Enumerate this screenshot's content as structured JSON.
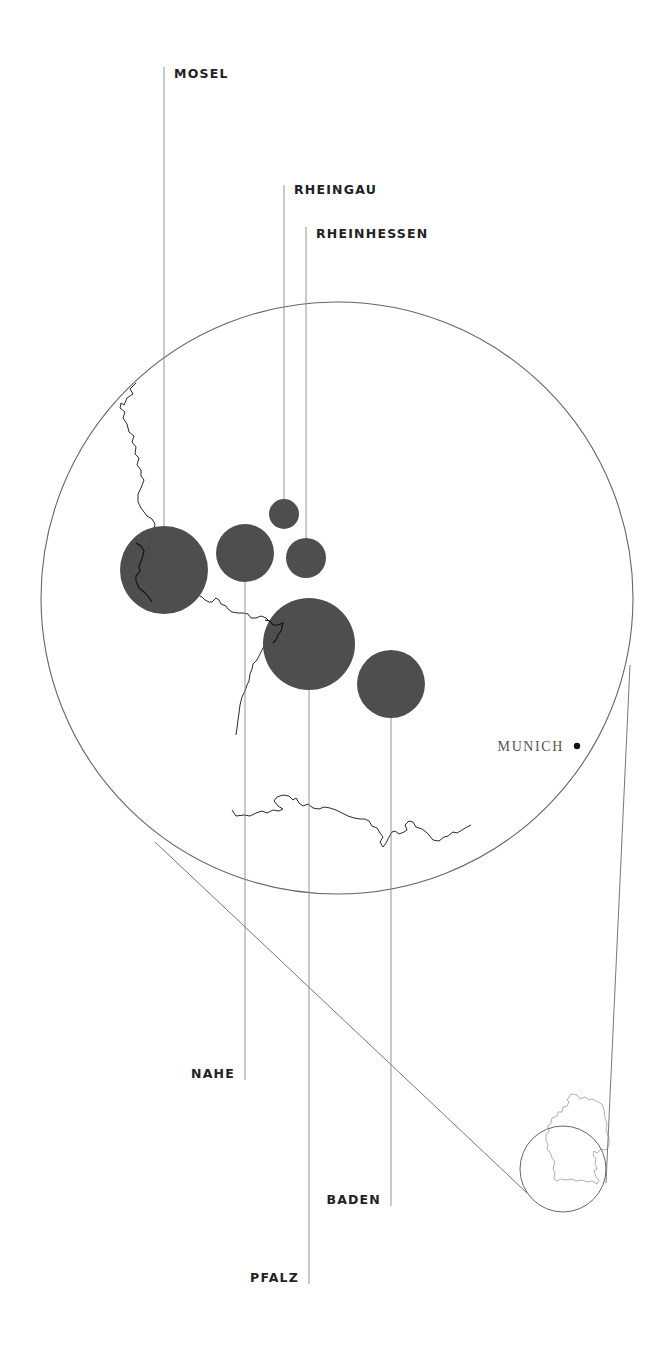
{
  "map": {
    "type": "wine-region-bubble-map",
    "country": "Germany",
    "colors": {
      "background": "#ffffff",
      "bubble": "#4a4a4a",
      "line": "#777777",
      "border": "#222222",
      "label": "#222222",
      "city_label": "#555555"
    },
    "regions": [
      {
        "name": "MOSEL",
        "cx": 164,
        "cy": 570,
        "r": 44,
        "label_x": 174,
        "label_y": 77,
        "line_top": 67,
        "line_bottom": 526,
        "label_side": "right"
      },
      {
        "name": "RHEINGAU",
        "cx": 284,
        "cy": 514,
        "r": 16,
        "label_x": 294,
        "label_y": 193,
        "line_top": 185,
        "line_bottom": 498,
        "label_side": "right"
      },
      {
        "name": "RHEINHESSEN",
        "cx": 306,
        "cy": 558,
        "r": 20,
        "label_x": 316,
        "label_y": 237,
        "line_top": 227,
        "line_bottom": 538,
        "label_side": "right"
      },
      {
        "name": "NAHE",
        "cx": 245,
        "cy": 553,
        "r": 29,
        "label_x": 236,
        "label_y": 1077,
        "line_top": 582,
        "line_bottom": 1080,
        "label_side": "left"
      },
      {
        "name": "PFALZ",
        "cx": 309,
        "cy": 644,
        "r": 46,
        "label_x": 299,
        "label_y": 1281,
        "line_top": 690,
        "line_bottom": 1284,
        "label_side": "left"
      },
      {
        "name": "BADEN",
        "cx": 391,
        "cy": 684,
        "r": 34,
        "label_x": 381,
        "label_y": 1203,
        "line_top": 718,
        "line_bottom": 1206,
        "label_side": "left"
      }
    ],
    "city": {
      "name": "MUNICH",
      "dot_x": 577,
      "dot_y": 745,
      "label_x": 565,
      "label_y": 750
    },
    "zoom_circle": {
      "cx": 337,
      "cy": 598,
      "r": 296
    },
    "inset_circle": {
      "cx": 563,
      "cy": 1169,
      "r": 43
    }
  }
}
